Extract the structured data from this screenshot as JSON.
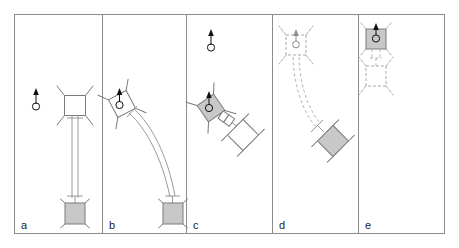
{
  "figure": {
    "panel_count": 5,
    "background_color": "#ffffff",
    "frame_color": "#8c8c8c",
    "outline_color": "#7a7a7a",
    "ghost_color": "#a8a8a8",
    "tether_color": "#9a9a9a",
    "fill_gray": "#c8c8c8",
    "fill_white": "#ffffff",
    "marker_color": "#111111"
  },
  "panels": [
    {
      "id": "a",
      "label": "a",
      "caption": "Straight fully-deployed tether; chaser body white, target body gray",
      "orientation_marker": {
        "present": true,
        "style": "solid",
        "heading": "up"
      },
      "chaser": {
        "fill": "white",
        "style": "solid",
        "rotation_deg": 0
      },
      "target": {
        "fill": "gray",
        "style": "solid",
        "shape": "square"
      },
      "tether": {
        "style": "straight",
        "line": "solid",
        "strands": 2
      }
    },
    {
      "id": "b",
      "label": "b",
      "caption": "Chaser rotated; tether bowed into a curved arc toward the target",
      "orientation_marker": {
        "present": true,
        "style": "solid",
        "heading": "up"
      },
      "chaser": {
        "fill": "white",
        "style": "solid",
        "rotation_deg": -28
      },
      "target": {
        "fill": "gray",
        "style": "solid",
        "shape": "square"
      },
      "tether": {
        "style": "curved",
        "line": "solid",
        "strands": 2
      }
    },
    {
      "id": "c",
      "label": "c",
      "caption": "Tether fully retracted; gray chaser docked to white diamond target",
      "orientation_marker": {
        "present": true,
        "style": "solid",
        "heading": "up"
      },
      "chaser": {
        "fill": "gray",
        "style": "solid",
        "rotation_deg": -35
      },
      "target": {
        "fill": "white",
        "style": "solid",
        "shape": "diamond"
      },
      "tether": {
        "style": "short-link",
        "line": "solid",
        "strands": 2
      }
    },
    {
      "id": "d",
      "label": "d",
      "caption": "Ghosted chaser with dashed slack tether trailing to a gray diamond target",
      "orientation_marker": {
        "present": true,
        "style": "ghost",
        "heading": "up"
      },
      "chaser": {
        "fill": "none",
        "style": "ghost",
        "rotation_deg": 0
      },
      "target": {
        "fill": "gray",
        "style": "solid",
        "shape": "diamond"
      },
      "tether": {
        "style": "curved",
        "line": "dashed",
        "strands": 2
      }
    },
    {
      "id": "e",
      "label": "e",
      "caption": "Gray chaser above a ghosted chaser outline joined by a short dashed tether",
      "orientation_marker": {
        "present": true,
        "style": "solid",
        "heading": "up"
      },
      "chaser": {
        "fill": "gray",
        "style": "solid",
        "rotation_deg": 0
      },
      "target": {
        "fill": "none",
        "style": "ghost",
        "shape": "square"
      },
      "tether": {
        "style": "short-link",
        "line": "dashed",
        "strands": 2
      }
    }
  ],
  "labels": {
    "a": "a",
    "b": "b",
    "c": "c",
    "d": "d",
    "e": "e"
  }
}
